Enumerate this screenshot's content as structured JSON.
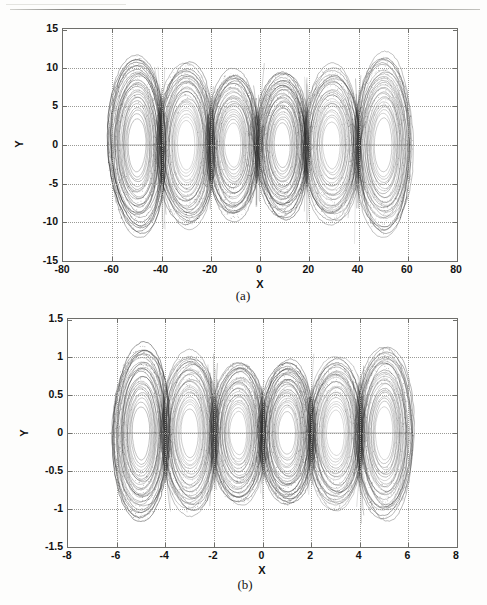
{
  "figure": {
    "panels": [
      {
        "id": "a",
        "caption": "(a)",
        "axis_title_x": "X",
        "axis_title_y": "Y",
        "xticks": [
          "-80",
          "-60",
          "-40",
          "-20",
          "0",
          "20",
          "40",
          "60",
          "80"
        ],
        "yticks": [
          "15",
          "10",
          "5",
          "0",
          "-5",
          "-10",
          "-15"
        ]
      },
      {
        "id": "b",
        "caption": "(b)",
        "axis_title_x": "X",
        "axis_title_y": "Y",
        "xticks": [
          "-8",
          "-6",
          "-4",
          "-2",
          "0",
          "2",
          "4",
          "6",
          "8"
        ],
        "yticks": [
          "1.5",
          "1",
          "0.5",
          "0",
          "-0.5",
          "-1",
          "-1.5"
        ]
      }
    ]
  },
  "colors": {
    "trace": "#2a2a2a",
    "axis": "#6e6e6a",
    "grid": "#9a9a96",
    "background": "#ffffff"
  },
  "chart_data": [
    {
      "type": "line",
      "title": "",
      "subtitle": "(a)",
      "xlabel": "X",
      "ylabel": "Y",
      "xlim": [
        -80,
        80
      ],
      "ylim": [
        -15,
        15
      ],
      "xticks": [
        -80,
        -60,
        -40,
        -20,
        0,
        20,
        40,
        60,
        80
      ],
      "yticks": [
        -15,
        -10,
        -5,
        0,
        5,
        10,
        15
      ],
      "grid": true,
      "legend": "none",
      "description": "Six-scroll chaotic attractor phase portrait; dense nested quasi-elliptical orbit bands chained along the X axis",
      "scroll_count": 6,
      "scroll_centers_x": [
        -50,
        -30,
        -11,
        9,
        29,
        50
      ],
      "scroll_centers_y": [
        0,
        0,
        0,
        0,
        0,
        0
      ],
      "scroll_radius_x": [
        12,
        12,
        11,
        11,
        12,
        12
      ],
      "scroll_radius_y": [
        11.5,
        10.5,
        9.5,
        9.5,
        10,
        11.5
      ],
      "data_extent_x": [
        -62,
        62
      ],
      "data_extent_y": [
        -12.0,
        12.5
      ],
      "rings_per_scroll": 26
    },
    {
      "type": "line",
      "title": "",
      "subtitle": "(b)",
      "xlabel": "X",
      "ylabel": "Y",
      "xlim": [
        -8,
        8
      ],
      "ylim": [
        -1.5,
        1.5
      ],
      "xticks": [
        -8,
        -6,
        -4,
        -2,
        0,
        2,
        4,
        6,
        8
      ],
      "yticks": [
        -1.5,
        -1,
        -0.5,
        0,
        0.5,
        1,
        1.5
      ],
      "grid": true,
      "legend": "none",
      "description": "Six-scroll chaotic attractor phase portrait on rescaled axes; dense nested quasi-elliptical orbit bands chained along the X axis",
      "scroll_count": 6,
      "scroll_centers_x": [
        -5.0,
        -3.0,
        -1.0,
        1.0,
        3.0,
        5.0
      ],
      "scroll_centers_y": [
        0,
        0,
        0,
        0,
        0,
        0
      ],
      "scroll_radius_x": [
        1.2,
        1.2,
        1.15,
        1.15,
        1.2,
        1.2
      ],
      "scroll_radius_y": [
        1.15,
        1.05,
        0.95,
        0.95,
        1.0,
        1.15
      ],
      "data_extent_x": [
        -6.3,
        6.2
      ],
      "data_extent_y": [
        -1.2,
        1.4
      ],
      "rings_per_scroll": 26
    }
  ]
}
